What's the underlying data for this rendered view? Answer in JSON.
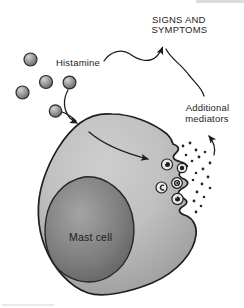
{
  "labels": {
    "signs_symptoms": {
      "line1": "SIGNS AND",
      "line2": "SYMPTOMS"
    },
    "histamine": "Histamine",
    "additional_mediators": {
      "line1": "Additional",
      "line2": "mediators"
    },
    "mast_cell": "Mast cell"
  },
  "colors": {
    "background": "#ffffff",
    "line": "#1d1d1d",
    "label_text": "#1d1d1d",
    "mast_cell_label": "#f2f2f2",
    "cytoplasm_light": "#cdcdcd",
    "cytoplasm_dark": "#989898",
    "nucleus_light": "#a4a4a4",
    "nucleus_dark": "#5a5a5a",
    "molecule_light": "#d2d2d2",
    "molecule_dark": "#636363",
    "granule_fill": "#ececec",
    "granule_core": "#1e1e1e",
    "mediator_dot": "#262626",
    "edge_artifact": "#dcdcdc"
  },
  "elements": {
    "histamine_molecule_count": 5,
    "granule_count": 5,
    "mediator_dot_count": 20
  }
}
